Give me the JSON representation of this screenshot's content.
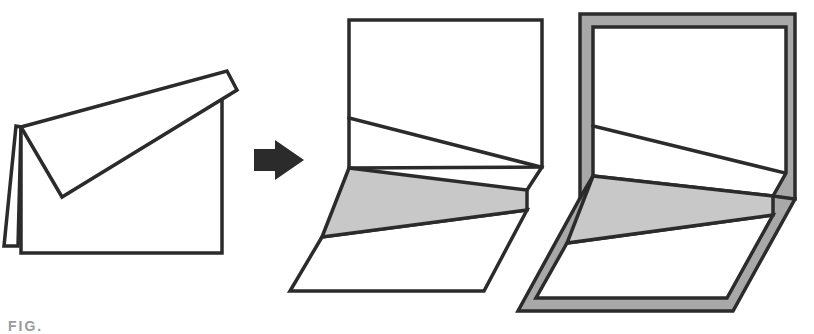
{
  "figure": {
    "caption_partial": "FIG.",
    "panels": [
      {
        "id": "folded-card",
        "description": "Folded card with a flap folded diagonally down over the front"
      },
      {
        "id": "transition-arrow",
        "description": "Right-pointing arrow indicating next step"
      },
      {
        "id": "opened-card",
        "description": "Card opened with a shaded triangular band at the fold"
      },
      {
        "id": "framed-card",
        "description": "Opened card with a gray frame border"
      }
    ],
    "colors": {
      "line": "#2b2b2b",
      "shade": "#c8c8c8",
      "frame": "#a8a8a8",
      "background": "#ffffff"
    }
  }
}
